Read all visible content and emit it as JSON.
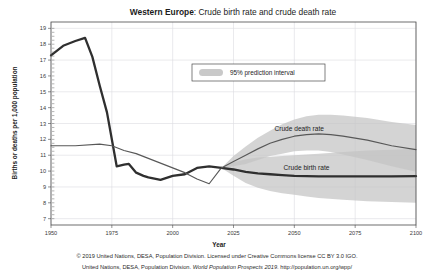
{
  "chart_data": {
    "type": "line",
    "title_region": "Western Europe",
    "title_rest": ": Crude birth rate and crude death rate",
    "title_full": "Western Europe: Crude birth rate and crude death rate",
    "xlabel": "Year",
    "ylabel": "Births or deaths per 1,000 population",
    "xlim": [
      1950,
      2100
    ],
    "ylim": [
      6.6,
      19.4
    ],
    "xticks": [
      1950,
      1975,
      2000,
      2025,
      2050,
      2075,
      2100
    ],
    "xticklabels": [
      "1950",
      "1975",
      "2000",
      "2025",
      "2050",
      "2075",
      "2100"
    ],
    "yticks": [
      7,
      8,
      9,
      10,
      11,
      12,
      13,
      14,
      15,
      16,
      17,
      18,
      19
    ],
    "yticklabels": [
      "7",
      "8",
      "9",
      "10",
      "11",
      "12",
      "13",
      "14",
      "15",
      "16",
      "17",
      "18",
      "19"
    ],
    "grid": true,
    "legend": {
      "position": "upper-center",
      "entries": [
        {
          "label": "95% prediction interval",
          "color": "#c9c9c9",
          "kind": "band"
        }
      ]
    },
    "annotations": [
      {
        "text": "Crude death rate",
        "x": 2052,
        "y": 12.55
      },
      {
        "text": "Crude birth rate",
        "x": 2055,
        "y": 10.05
      }
    ],
    "projection_start": 2020,
    "series": [
      {
        "name": "Crude birth rate",
        "color": "#2f2f2f",
        "x": [
          1950,
          1955,
          1960,
          1964,
          1967,
          1970,
          1973,
          1977,
          1980,
          1982,
          1985,
          1988,
          1990,
          1995,
          2000,
          2005,
          2010,
          2015,
          2020
        ],
        "values": [
          17.3,
          17.9,
          18.2,
          18.4,
          17.2,
          15.4,
          13.7,
          10.3,
          10.4,
          10.45,
          9.9,
          9.7,
          9.6,
          9.45,
          9.7,
          9.8,
          10.2,
          10.3,
          10.2
        ]
      },
      {
        "name": "Crude death rate",
        "color": "#585858",
        "x": [
          1950,
          1960,
          1970,
          1975,
          1980,
          1985,
          1990,
          1995,
          2000,
          2005,
          2010,
          2015,
          2020
        ],
        "values": [
          11.6,
          11.6,
          11.7,
          11.6,
          11.3,
          11.1,
          10.8,
          10.5,
          10.2,
          9.9,
          9.5,
          9.2,
          10.2
        ]
      },
      {
        "name": "Crude birth rate (projected median)",
        "color": "#2f2f2f",
        "x": [
          2020,
          2025,
          2030,
          2035,
          2040,
          2045,
          2050,
          2055,
          2060,
          2070,
          2080,
          2090,
          2100
        ],
        "values": [
          10.2,
          10.1,
          9.95,
          9.85,
          9.8,
          9.75,
          9.7,
          9.68,
          9.67,
          9.66,
          9.66,
          9.67,
          9.68
        ]
      },
      {
        "name": "Crude death rate (projected median)",
        "color": "#585858",
        "x": [
          2020,
          2025,
          2030,
          2035,
          2040,
          2045,
          2050,
          2055,
          2060,
          2065,
          2070,
          2080,
          2090,
          2100
        ],
        "values": [
          10.2,
          10.6,
          11.0,
          11.4,
          11.75,
          12.0,
          12.2,
          12.3,
          12.35,
          12.3,
          12.2,
          11.95,
          11.6,
          11.35
        ]
      }
    ],
    "bands": [
      {
        "name": "Crude birth rate 95% prediction interval",
        "color": "#c4c4c4",
        "x": [
          2020,
          2025,
          2030,
          2035,
          2040,
          2045,
          2050,
          2055,
          2060,
          2070,
          2080,
          2090,
          2100
        ],
        "upper": [
          10.2,
          10.55,
          10.75,
          10.85,
          10.9,
          10.95,
          11.0,
          11.05,
          11.1,
          11.2,
          11.3,
          11.35,
          11.4
        ],
        "lower": [
          10.2,
          9.7,
          9.25,
          8.95,
          8.75,
          8.6,
          8.5,
          8.4,
          8.3,
          8.2,
          8.1,
          8.05,
          8.0
        ]
      },
      {
        "name": "Crude death rate 95% prediction interval",
        "color": "#c4c4c4",
        "x": [
          2020,
          2025,
          2030,
          2035,
          2040,
          2045,
          2050,
          2055,
          2060,
          2065,
          2070,
          2080,
          2090,
          2100
        ],
        "upper": [
          10.2,
          10.95,
          11.55,
          12.1,
          12.55,
          12.95,
          13.25,
          13.45,
          13.55,
          13.55,
          13.5,
          13.35,
          13.1,
          12.9
        ],
        "lower": [
          10.2,
          10.3,
          10.45,
          10.7,
          10.95,
          11.1,
          11.25,
          11.3,
          11.3,
          11.2,
          11.05,
          10.7,
          10.3,
          9.95
        ]
      }
    ]
  },
  "footer": {
    "line1": "© 2019 United Nations, DESA, Population Division. Licensed under Creative Commons license CC BY 3.0 IGO.",
    "line2_pre": "United Nations, DESA, Population Division. ",
    "line2_italic": "World Population Prospects 2019",
    "line2_post": ". http://population.un.org/wpp/"
  }
}
